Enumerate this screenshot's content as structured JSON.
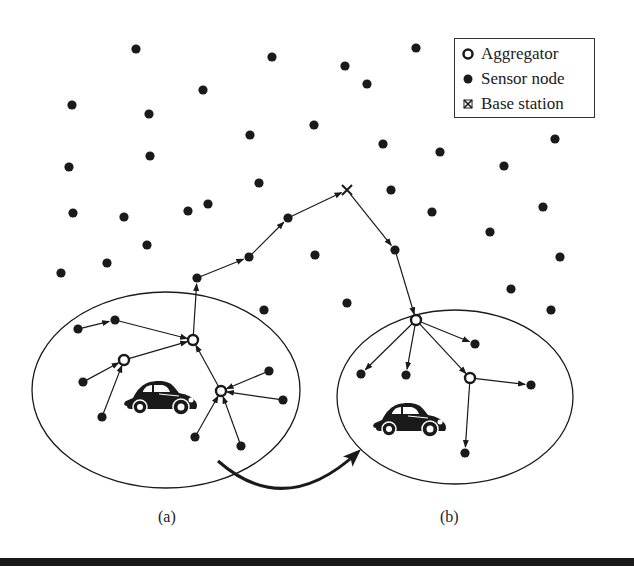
{
  "colors": {
    "ink": "#1a1a1a",
    "background": "#ffffff"
  },
  "legend": {
    "items": [
      {
        "symbol": "aggregator-icon",
        "label": "Aggregator"
      },
      {
        "symbol": "sensor-node-icon",
        "label": "Sensor node"
      },
      {
        "symbol": "base-station-icon",
        "label": "Base station"
      }
    ]
  },
  "captions": {
    "a": "(a)",
    "b": "(b)"
  },
  "diagram": {
    "base_station": {
      "x": 347,
      "y": 190
    },
    "regions": [
      {
        "id": "a",
        "cx": 166,
        "cy": 390,
        "rx": 134,
        "ry": 98,
        "car": {
          "x": 123,
          "y": 378,
          "w": 76,
          "h": 38
        }
      },
      {
        "id": "b",
        "cx": 455,
        "cy": 397,
        "rx": 118,
        "ry": 87,
        "car": {
          "x": 372,
          "y": 400,
          "w": 76,
          "h": 38
        }
      }
    ],
    "aggregators": [
      {
        "id": "A",
        "x": 193,
        "y": 340
      },
      {
        "id": "B",
        "x": 124,
        "y": 360
      },
      {
        "id": "C",
        "x": 221,
        "y": 391
      },
      {
        "id": "D",
        "x": 416,
        "y": 320
      },
      {
        "id": "E",
        "x": 470,
        "y": 378
      }
    ],
    "sensors": [
      [
        136,
        49
      ],
      [
        272,
        57
      ],
      [
        203,
        90
      ],
      [
        72,
        105
      ],
      [
        149,
        114
      ],
      [
        250,
        135
      ],
      [
        314,
        125
      ],
      [
        150,
        156
      ],
      [
        69,
        167
      ],
      [
        416,
        48
      ],
      [
        345,
        66
      ],
      [
        367,
        84
      ],
      [
        383,
        144
      ],
      [
        440,
        152
      ],
      [
        504,
        166
      ],
      [
        555,
        139
      ],
      [
        259,
        183
      ],
      [
        391,
        190
      ],
      [
        432,
        212
      ],
      [
        490,
        232
      ],
      [
        543,
        207
      ],
      [
        73,
        213
      ],
      [
        124,
        217
      ],
      [
        188,
        211
      ],
      [
        208,
        204
      ],
      [
        147,
        245
      ],
      [
        107,
        263
      ],
      [
        61,
        273
      ],
      [
        197,
        278
      ],
      [
        249,
        257
      ],
      [
        288,
        218
      ],
      [
        315,
        255
      ],
      [
        395,
        250
      ],
      [
        560,
        257
      ],
      [
        511,
        289
      ],
      [
        551,
        310
      ],
      [
        264,
        310
      ],
      [
        347,
        303
      ],
      [
        78,
        329
      ],
      [
        115,
        320
      ],
      [
        83,
        382
      ],
      [
        102,
        417
      ],
      [
        269,
        371
      ],
      [
        283,
        400
      ],
      [
        195,
        437
      ],
      [
        241,
        446
      ],
      [
        361,
        374
      ],
      [
        406,
        375
      ],
      [
        475,
        344
      ],
      [
        531,
        385
      ],
      [
        465,
        453
      ]
    ],
    "arrows": [
      {
        "from": [
          78,
          329
        ],
        "to": [
          115,
          320
        ]
      },
      {
        "from": [
          115,
          320
        ],
        "to": [
          193,
          340
        ]
      },
      {
        "from": [
          83,
          382
        ],
        "to": [
          124,
          360
        ]
      },
      {
        "from": [
          102,
          417
        ],
        "to": [
          124,
          360
        ]
      },
      {
        "from": [
          124,
          360
        ],
        "to": [
          193,
          340
        ]
      },
      {
        "from": [
          269,
          371
        ],
        "to": [
          221,
          391
        ]
      },
      {
        "from": [
          283,
          400
        ],
        "to": [
          221,
          391
        ]
      },
      {
        "from": [
          195,
          437
        ],
        "to": [
          221,
          391
        ]
      },
      {
        "from": [
          241,
          446
        ],
        "to": [
          221,
          391
        ]
      },
      {
        "from": [
          221,
          391
        ],
        "to": [
          193,
          340
        ]
      },
      {
        "from": [
          193,
          340
        ],
        "to": [
          197,
          278
        ]
      },
      {
        "from": [
          197,
          278
        ],
        "to": [
          249,
          257
        ]
      },
      {
        "from": [
          249,
          257
        ],
        "to": [
          288,
          218
        ]
      },
      {
        "from": [
          288,
          218
        ],
        "to": [
          347,
          190
        ]
      },
      {
        "from": [
          347,
          190
        ],
        "to": [
          395,
          250
        ]
      },
      {
        "from": [
          395,
          250
        ],
        "to": [
          416,
          320
        ]
      },
      {
        "from": [
          416,
          320
        ],
        "to": [
          361,
          374
        ]
      },
      {
        "from": [
          416,
          320
        ],
        "to": [
          406,
          375
        ]
      },
      {
        "from": [
          416,
          320
        ],
        "to": [
          475,
          344
        ]
      },
      {
        "from": [
          416,
          320
        ],
        "to": [
          470,
          378
        ]
      },
      {
        "from": [
          470,
          378
        ],
        "to": [
          531,
          385
        ]
      },
      {
        "from": [
          470,
          378
        ],
        "to": [
          465,
          453
        ]
      }
    ],
    "movement_arrow": {
      "path": "M218,461 Q285,520 358,452"
    }
  }
}
